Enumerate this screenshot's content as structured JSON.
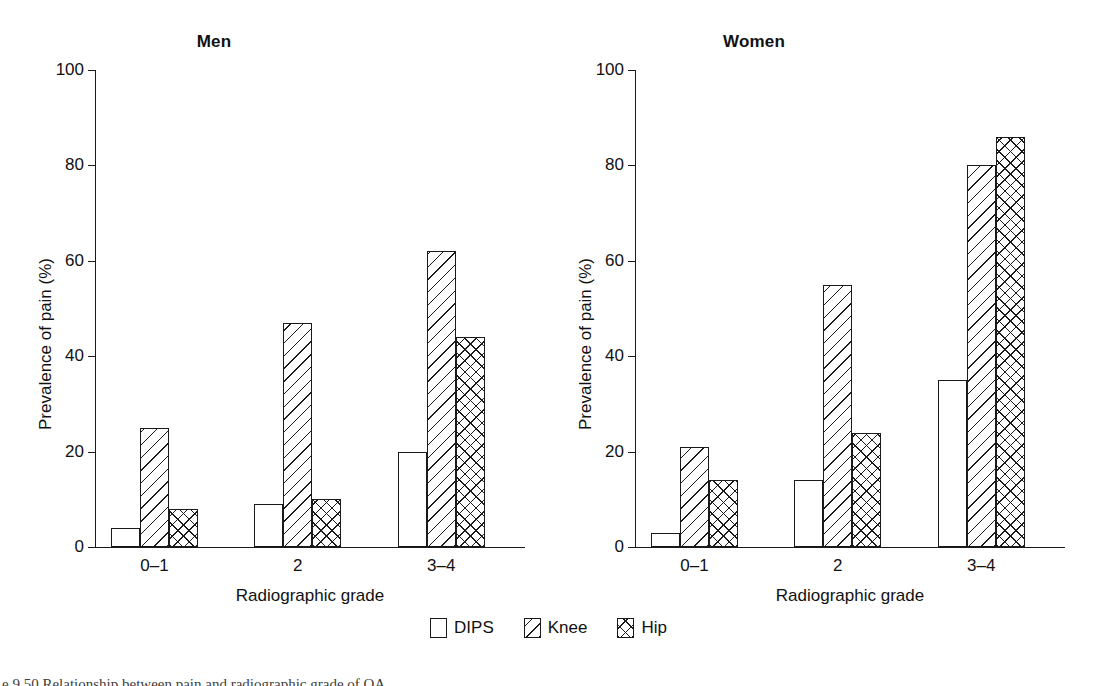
{
  "figure": {
    "caption": "e 9.50   Relationship between pain and radiographic grade of OA."
  },
  "legend": {
    "items": [
      {
        "label": "DIPS",
        "pattern": "solid-white",
        "icon": "square-empty-icon"
      },
      {
        "label": "Knee",
        "pattern": "diagonal-hatch",
        "icon": "square-hatch-icon"
      },
      {
        "label": "Hip",
        "pattern": "cross-hatch",
        "icon": "square-crosshatch-icon"
      }
    ]
  },
  "chart_data": {
    "type": "bar",
    "title": "Relationship between pain and radiographic grade of OA",
    "panels": [
      {
        "title": "Men",
        "categories": [
          "0–1",
          "2",
          "3–4"
        ],
        "series": [
          {
            "name": "DIPS",
            "values": [
              4,
              9,
              20
            ]
          },
          {
            "name": "Knee",
            "values": [
              25,
              47,
              62
            ]
          },
          {
            "name": "Hip",
            "values": [
              8,
              10,
              44
            ]
          }
        ]
      },
      {
        "title": "Women",
        "categories": [
          "0–1",
          "2",
          "3–4"
        ],
        "series": [
          {
            "name": "DIPS",
            "values": [
              3,
              14,
              35
            ]
          },
          {
            "name": "Knee",
            "values": [
              21,
              55,
              80
            ]
          },
          {
            "name": "Hip",
            "values": [
              14,
              24,
              86
            ]
          }
        ]
      }
    ],
    "xlabel": "Radiographic grade",
    "ylabel": "Prevalence of pain (%)",
    "ylim": [
      0,
      100
    ],
    "yticks": [
      0,
      20,
      40,
      60,
      80,
      100
    ],
    "ytick_labels": [
      "0",
      "20",
      "40",
      "60",
      "80",
      "100"
    ],
    "grid": false,
    "legend_position": "bottom-center",
    "legend_entries": [
      "DIPS",
      "Knee",
      "Hip"
    ]
  },
  "colors": {
    "ink": "#1a1a1a",
    "background": "#ffffff"
  }
}
